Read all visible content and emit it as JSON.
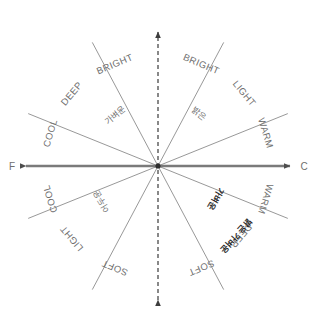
{
  "diagram": {
    "type": "radial-image-scale",
    "background_color": "#ffffff",
    "line_color": "#8c8c8c",
    "axis_color": "#7a7a7a",
    "label_color": "#6f6f6f",
    "bold_label_color": "#2b2b2b",
    "center": {
      "x": 158,
      "y": 166
    }
  },
  "axes": {
    "horizontal": {
      "left_cap": "F",
      "right_cap": "C",
      "style": "solid-double-arrow"
    },
    "vertical": {
      "top_cap": "",
      "bottom_cap": "",
      "style": "dashed-double-arrow"
    }
  },
  "labels": [
    {
      "id": "bright-left",
      "text": "BRIGHT",
      "script": "latin",
      "weight": "normal",
      "angle_deg": 113,
      "radius": 110
    },
    {
      "id": "bright-right",
      "text": "BRIGHT",
      "script": "latin",
      "weight": "normal",
      "angle_deg": 67,
      "radius": 110
    },
    {
      "id": "deep-upper-left",
      "text": "DEEP",
      "script": "latin",
      "weight": "normal",
      "angle_deg": 140,
      "radius": 112
    },
    {
      "id": "light-upper-right",
      "text": "LIGHT",
      "script": "latin",
      "weight": "normal",
      "angle_deg": 40,
      "radius": 112
    },
    {
      "id": "cool-upper-left",
      "text": "COOL",
      "script": "latin",
      "weight": "normal",
      "angle_deg": 163,
      "radius": 112
    },
    {
      "id": "warm-upper-right",
      "text": "WARM",
      "script": "latin",
      "weight": "normal",
      "angle_deg": 17,
      "radius": 112
    },
    {
      "id": "cool-lower-left",
      "text": "COOL",
      "script": "latin",
      "weight": "normal",
      "angle_deg": 197,
      "radius": 112
    },
    {
      "id": "warm-lower-right",
      "text": "WARM",
      "script": "latin",
      "weight": "normal",
      "angle_deg": 343,
      "radius": 112
    },
    {
      "id": "light-lower-left",
      "text": "LIGHT",
      "script": "latin",
      "weight": "normal",
      "angle_deg": 220,
      "radius": 112
    },
    {
      "id": "deep-lower-right",
      "text": "DEEP",
      "script": "latin",
      "weight": "normal",
      "angle_deg": 320,
      "radius": 108
    },
    {
      "id": "soft-lower-left",
      "text": "SOFT",
      "script": "latin",
      "weight": "normal",
      "angle_deg": 247,
      "radius": 110
    },
    {
      "id": "soft-lower-right",
      "text": "SOFT",
      "script": "latin",
      "weight": "normal",
      "angle_deg": 293,
      "radius": 110
    },
    {
      "id": "kr-upper-left",
      "text": "가벼운",
      "script": "hangul",
      "weight": "normal",
      "angle_deg": 130,
      "radius": 66
    },
    {
      "id": "kr-upper-right",
      "text": "밝은",
      "script": "hangul",
      "weight": "normal",
      "angle_deg": 52,
      "radius": 66
    },
    {
      "id": "kr-lower-left",
      "text": "어두운",
      "script": "hangul",
      "weight": "normal",
      "angle_deg": 212,
      "radius": 66
    },
    {
      "id": "kr-lower-right",
      "text": "가벼운",
      "script": "hangul",
      "weight": "bold",
      "angle_deg": 330,
      "radius": 66
    },
    {
      "id": "kr-lower-right-2",
      "text": "밝은 가벼운",
      "script": "hangul",
      "weight": "bold",
      "angle_deg": 318,
      "radius": 104
    }
  ],
  "rays": [
    {
      "id": "ray-0",
      "angle_deg": 0,
      "length": 140,
      "kind": "axis"
    },
    {
      "id": "ray-30",
      "angle_deg": 22,
      "length": 140,
      "kind": "diagonal"
    },
    {
      "id": "ray-60",
      "angle_deg": 62,
      "length": 140,
      "kind": "diagonal"
    },
    {
      "id": "ray-90",
      "angle_deg": 90,
      "length": 140,
      "kind": "axis"
    },
    {
      "id": "ray-120",
      "angle_deg": 118,
      "length": 140,
      "kind": "diagonal"
    },
    {
      "id": "ray-150",
      "angle_deg": 158,
      "length": 140,
      "kind": "diagonal"
    },
    {
      "id": "ray-180",
      "angle_deg": 180,
      "length": 140,
      "kind": "axis"
    },
    {
      "id": "ray-210",
      "angle_deg": 202,
      "length": 140,
      "kind": "diagonal"
    },
    {
      "id": "ray-240",
      "angle_deg": 242,
      "length": 140,
      "kind": "diagonal"
    },
    {
      "id": "ray-270",
      "angle_deg": 270,
      "length": 140,
      "kind": "axis"
    },
    {
      "id": "ray-300",
      "angle_deg": 298,
      "length": 140,
      "kind": "diagonal"
    },
    {
      "id": "ray-330",
      "angle_deg": 338,
      "length": 140,
      "kind": "diagonal"
    }
  ]
}
